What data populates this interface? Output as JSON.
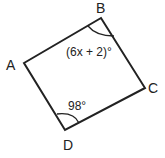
{
  "figure": {
    "shape": "quadrilateral",
    "vertices": [
      {
        "name": "A",
        "label": "A"
      },
      {
        "name": "B",
        "label": "B"
      },
      {
        "name": "C",
        "label": "C"
      },
      {
        "name": "D",
        "label": "D"
      }
    ],
    "angles": [
      {
        "vertex": "B",
        "label": "(6x + 2)°"
      },
      {
        "vertex": "D",
        "label": "98°"
      }
    ],
    "stroke_color": "#222222"
  }
}
